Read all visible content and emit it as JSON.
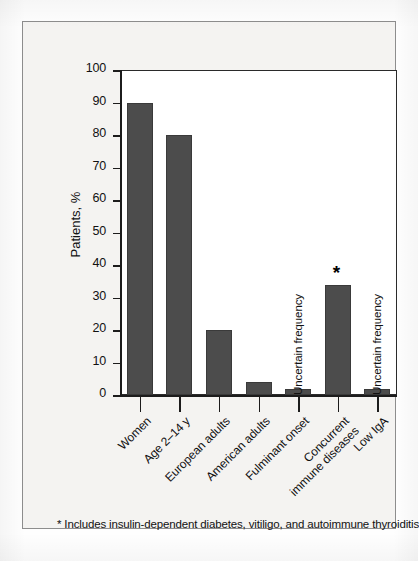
{
  "chart_data": {
    "type": "bar",
    "title": "",
    "subtitle": "",
    "xlabel": "",
    "ylabel": "Patients, %",
    "ylim": [
      0,
      100
    ],
    "ytick_values": [
      100,
      90,
      80,
      70,
      60,
      50,
      40,
      30,
      20,
      10,
      0
    ],
    "ytick_labels": [
      "100",
      "90",
      "80",
      "70",
      "60",
      "50",
      "40",
      "30",
      "20",
      "10",
      "0"
    ],
    "grid": false,
    "legend": false,
    "legend_position": "none",
    "bar_color": "#4c4c4c",
    "categories": [
      "Women",
      "Age 2–14 y",
      "European adults",
      "American adults",
      "Fulminant onset",
      "Concurrent immune diseases",
      "Low IgA"
    ],
    "values": [
      90,
      80,
      20,
      4,
      2,
      34,
      2
    ],
    "bars": [
      {
        "label": "Women",
        "label_line1": "Women",
        "label_line2": "",
        "value": 90,
        "annotation": "",
        "marker": ""
      },
      {
        "label": "Age 2–14 y",
        "label_line1": "Age 2–14 y",
        "label_line2": "",
        "value": 80,
        "annotation": "",
        "marker": ""
      },
      {
        "label": "European adults",
        "label_line1": "European adults",
        "label_line2": "",
        "value": 20,
        "annotation": "",
        "marker": ""
      },
      {
        "label": "American adults",
        "label_line1": "American adults",
        "label_line2": "",
        "value": 4,
        "annotation": "",
        "marker": ""
      },
      {
        "label": "Fulminant onset",
        "label_line1": "Fulminant onset",
        "label_line2": "",
        "value": 2,
        "annotation": "Uncertain frequency",
        "marker": ""
      },
      {
        "label": "Concurrent immune diseases",
        "label_line1": "Concurrent",
        "label_line2": "immune diseases",
        "value": 34,
        "annotation": "",
        "marker": "*"
      },
      {
        "label": "Low IgA",
        "label_line1": "Low IgA",
        "label_line2": "",
        "value": 2,
        "annotation": "Uncertain frequency",
        "marker": ""
      }
    ],
    "annotations": [
      {
        "text": "Uncertain frequency",
        "category": "Fulminant onset"
      },
      {
        "text": "Uncertain frequency",
        "category": "Low IgA"
      },
      {
        "text": "*",
        "category": "Concurrent immune diseases"
      }
    ],
    "footnote": "* Includes insulin-dependent diabetes, vitiligo, and autoimmune thyroiditis"
  }
}
